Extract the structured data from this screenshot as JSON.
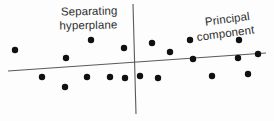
{
  "figure": {
    "width": 274,
    "height": 121,
    "background_color": "#fdfdfd",
    "dot_color": "#101010",
    "line_color": "#5a5a5a",
    "text_color": "#2e2e2e"
  },
  "labels": {
    "separating_hyperplane": {
      "line1": "Separating",
      "line2": "hyperplane"
    },
    "principal_component": {
      "line1": "Principal",
      "line2": "component"
    }
  },
  "chart_data": {
    "type": "scatter",
    "title": "",
    "subtitle": "",
    "xlabel": "",
    "ylabel": "",
    "xlim": [
      0,
      274
    ],
    "ylim": [
      0,
      121
    ],
    "grid": false,
    "legend_position": "none",
    "point_radius": 3.2,
    "series": [
      {
        "name": "data points",
        "color": "#101010",
        "points": [
          [
            15,
            50
          ],
          [
            66,
            58
          ],
          [
            91,
            40
          ],
          [
            42,
            77
          ],
          [
            65,
            87
          ],
          [
            87,
            77
          ],
          [
            110,
            77
          ],
          [
            124,
            48
          ],
          [
            125,
            78
          ],
          [
            140,
            76
          ],
          [
            152,
            43
          ],
          [
            158,
            78
          ],
          [
            170,
            52
          ],
          [
            190,
            40
          ],
          [
            193,
            59
          ],
          [
            212,
            76
          ],
          [
            238,
            58
          ],
          [
            239,
            40
          ],
          [
            248,
            74
          ],
          [
            258,
            54
          ]
        ]
      }
    ],
    "annotations": [
      {
        "name": "separating-hyperplane-line",
        "kind": "line",
        "label": "Separating hyperplane",
        "x1": 133,
        "y1": 4,
        "x2": 136,
        "y2": 114
      },
      {
        "name": "principal-component-line",
        "kind": "line",
        "label": "Principal component",
        "x1": 8,
        "y1": 71,
        "x2": 266,
        "y2": 53
      },
      {
        "name": "separating-hyperplane-label",
        "kind": "text",
        "text": "Separating hyperplane",
        "x": 110,
        "y": 12,
        "rotation": -1.2
      },
      {
        "name": "principal-component-label",
        "kind": "text",
        "text": "Principal component",
        "x": 196,
        "y": 24,
        "rotation": -7.5
      }
    ]
  }
}
